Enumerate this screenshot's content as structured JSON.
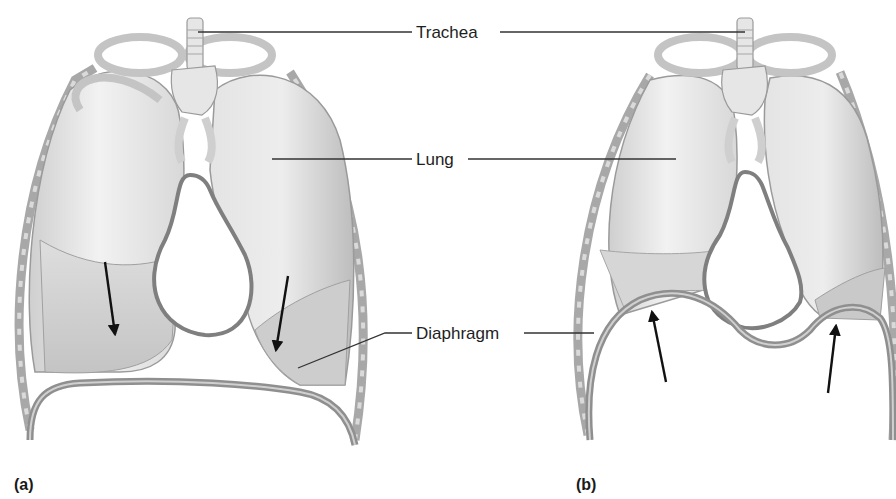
{
  "figure": {
    "labels": {
      "trachea": "Trachea",
      "lung": "Lung",
      "diaphragm": "Diaphragm"
    },
    "panels": [
      {
        "id": "a",
        "label": "(a)",
        "state": "diaphragm contracted, flattened; arrows point downward"
      },
      {
        "id": "b",
        "label": "(b)",
        "state": "diaphragm relaxed, dome-shaped; arrows point upward"
      }
    ],
    "colors": {
      "tissue_light": "#ececec",
      "tissue_mid": "#cfcfcf",
      "tissue_dark": "#9a9a9a",
      "outline": "#7a7a7a",
      "arrow": "#111111",
      "leader_line": "#333333"
    }
  }
}
